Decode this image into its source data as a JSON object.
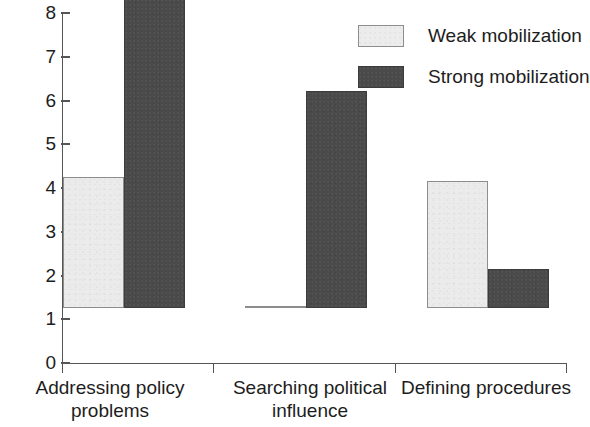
{
  "chart_data": {
    "type": "bar",
    "title": "",
    "xlabel": "",
    "ylabel": "",
    "ylim": [
      0,
      8
    ],
    "yticks": [
      0,
      1,
      2,
      3,
      4,
      5,
      6,
      7,
      8
    ],
    "grid": false,
    "legend_position": "top-right",
    "categories": [
      "Addressing policy problems",
      "Searching political influence",
      "Defining procedures"
    ],
    "category_lines": [
      [
        "Addressing policy",
        "problems"
      ],
      [
        "Searching political",
        "influence"
      ],
      [
        "Defining procedures"
      ]
    ],
    "series": [
      {
        "name": "Weak mobilization",
        "color": "#ebebeb",
        "values": [
          3,
          0.05,
          2.9
        ]
      },
      {
        "name": "Strong mobilization",
        "color": "#4a4a4a",
        "values": [
          8,
          4.95,
          0.9
        ]
      }
    ]
  },
  "legend": {
    "items": [
      {
        "label": "Weak mobilization",
        "swatch": "weak-swatch"
      },
      {
        "label": "Strong mobilization",
        "swatch": "strong-swatch"
      }
    ]
  },
  "axis": {
    "y_tick_labels": [
      "8",
      "7",
      "6",
      "5",
      "4",
      "3",
      "2",
      "1",
      "0"
    ]
  }
}
